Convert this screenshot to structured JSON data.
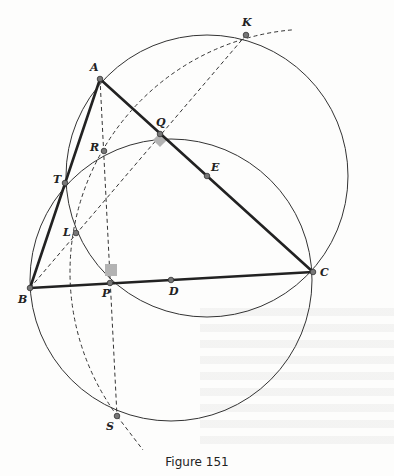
{
  "figure": {
    "caption": "Figure 151",
    "colors": {
      "line": "#222222",
      "thin_line": "#333333",
      "right_angle_marker": "#b3b3b3",
      "point_fill": "#777777",
      "background": "#fdfdfc"
    },
    "points": [
      {
        "name": "A",
        "x": 100,
        "y": 79,
        "label_dx": -10,
        "label_dy": -8
      },
      {
        "name": "K",
        "x": 246,
        "y": 35,
        "label_dx": -4,
        "label_dy": -9
      },
      {
        "name": "Q",
        "x": 160,
        "y": 134,
        "label_dx": -4,
        "label_dy": -8
      },
      {
        "name": "R",
        "x": 104,
        "y": 151,
        "label_dx": -14,
        "label_dy": 0
      },
      {
        "name": "E",
        "x": 207,
        "y": 176,
        "label_dx": 4,
        "label_dy": -5
      },
      {
        "name": "T",
        "x": 65,
        "y": 183,
        "label_dx": -12,
        "label_dy": 0
      },
      {
        "name": "L",
        "x": 76,
        "y": 233,
        "label_dx": -13,
        "label_dy": 3
      },
      {
        "name": "C",
        "x": 313,
        "y": 272,
        "label_dx": 7,
        "label_dy": 4
      },
      {
        "name": "P",
        "x": 110,
        "y": 283,
        "label_dx": -8,
        "label_dy": 14
      },
      {
        "name": "D",
        "x": 171,
        "y": 280,
        "label_dx": -2,
        "label_dy": 15
      },
      {
        "name": "B",
        "x": 30,
        "y": 288,
        "label_dx": -12,
        "label_dy": 15
      },
      {
        "name": "S",
        "x": 117,
        "y": 416,
        "label_dx": -11,
        "label_dy": 14
      }
    ],
    "segments_bold": [
      {
        "from": "A",
        "to": "B"
      },
      {
        "from": "A",
        "to": "C"
      },
      {
        "from": "B",
        "to": "C"
      }
    ],
    "segments_dashed": [
      {
        "from": "A",
        "to": "S"
      },
      {
        "from": "B",
        "to": "K"
      },
      {
        "from": "S",
        "to_x": 143,
        "to_y": 450
      }
    ],
    "circles_solid": [
      {
        "name": "circle-diameter-AC",
        "cx": 207,
        "cy": 176,
        "r": 141
      },
      {
        "name": "circle-diameter-BC",
        "cx": 171,
        "cy": 280,
        "r": 141
      }
    ],
    "arc_dashed": {
      "name": "arc-center-C",
      "cx": 313,
      "cy": 272,
      "r": 243,
      "start_deg": -95,
      "end_deg": -215
    },
    "right_angles": [
      {
        "at": "Q",
        "size": 10,
        "rotate": 45,
        "dx": 0,
        "dy": 6
      },
      {
        "at": "P",
        "size": 12,
        "rotate": 0,
        "dx": 1,
        "dy": -13
      }
    ]
  }
}
